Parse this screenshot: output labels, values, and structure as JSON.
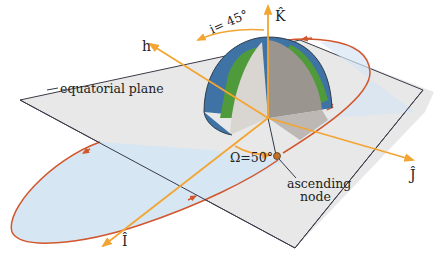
{
  "diagram": {
    "type": "orbital-elements",
    "labels": {
      "k_axis": "K̂",
      "i_axis": "Î",
      "j_axis": "Ĵ",
      "h_vector": "h",
      "inclination": "i= 45°",
      "raan": "Ω=50°",
      "ascending_node_line1": "ascending",
      "ascending_node_line2": "node",
      "equatorial_plane": "equatorial plane"
    },
    "values": {
      "inclination_deg": 45,
      "raan_deg": 50
    },
    "colors": {
      "axis": "#f3a533",
      "orbit": "#d2562b",
      "orbit_fill": "#d6e6f3",
      "plane_fill": "#e8e8e8",
      "plane_edge": "#3a3a48",
      "ocean": "#3f73a6",
      "land": "#4f9a3a",
      "node_dot": "#c0702a"
    }
  }
}
